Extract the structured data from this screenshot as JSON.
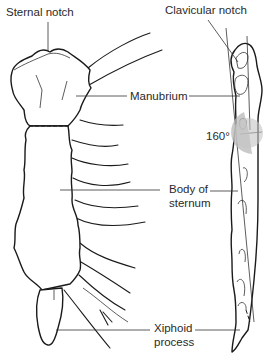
{
  "diagram": {
    "labels": {
      "sternal_notch": "Sternal notch",
      "clavicular_notch": "Clavicular notch",
      "manubrium": "Manubrium",
      "angle": "160°",
      "body_line1": "Body of",
      "body_line2": "sternum",
      "xiphoid_line1": "Xiphoid",
      "xiphoid_line2": "process"
    },
    "colors": {
      "line": "#1a1a1a",
      "angle_fill": "#b8b8b8",
      "background": "#ffffff"
    },
    "views": [
      "anterior",
      "lateral"
    ]
  }
}
